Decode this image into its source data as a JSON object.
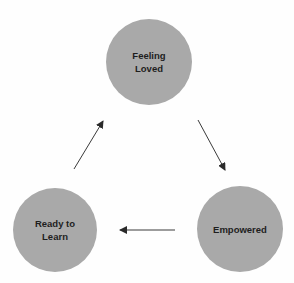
{
  "diagram": {
    "type": "cycle",
    "fill_color": "#a9a9a9",
    "text_color": "#1e1e1e",
    "arrow_color": "#3a3a3a",
    "nodes": [
      {
        "id": "feeling-loved",
        "label": "Feeling\nLoved",
        "cx": 149,
        "cy": 62,
        "r": 43
      },
      {
        "id": "empowered",
        "label": "Empowered",
        "cx": 240,
        "cy": 229,
        "r": 43
      },
      {
        "id": "ready-to-learn",
        "label": "Ready to\nLearn",
        "cx": 55,
        "cy": 230,
        "r": 42
      }
    ],
    "edges": [
      {
        "from": "feeling-loved",
        "to": "empowered",
        "x1": 198,
        "y1": 120,
        "x2": 225,
        "y2": 170
      },
      {
        "from": "empowered",
        "to": "ready-to-learn",
        "x1": 175,
        "y1": 230,
        "x2": 120,
        "y2": 230
      },
      {
        "from": "ready-to-learn",
        "to": "feeling-loved",
        "x1": 74,
        "y1": 169,
        "x2": 103,
        "y2": 121
      }
    ]
  }
}
